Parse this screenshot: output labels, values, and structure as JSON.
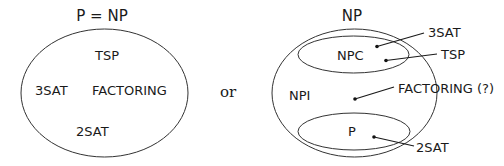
{
  "left_diagram": {
    "title": "P = NP",
    "items": {
      "tsp": "TSP",
      "threesat": "3SAT",
      "factoring": "FACTORING",
      "twosat": "2SAT"
    }
  },
  "connector": "or",
  "right_diagram": {
    "title": "NP",
    "regions": {
      "npc": "NPC",
      "npi": "NPI",
      "p": "P"
    },
    "pointers": {
      "threesat": "3SAT",
      "tsp": "TSP",
      "factoring": "FACTORING (?)",
      "twosat": "2SAT"
    }
  },
  "colors": {
    "stroke": "#333333",
    "text": "#1a1a1a",
    "background": "#ffffff"
  }
}
